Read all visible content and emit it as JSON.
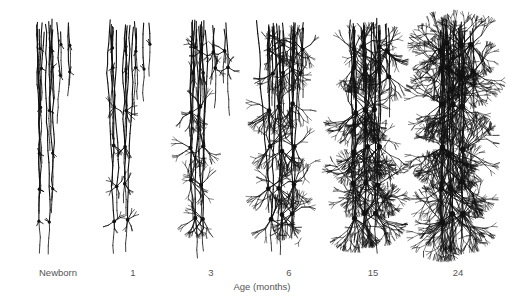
{
  "figure": {
    "axis_label": "Age (months)",
    "stages": [
      {
        "label": "Newborn",
        "x": 58,
        "density": 0
      },
      {
        "label": "1",
        "x": 133,
        "density": 1
      },
      {
        "label": "3",
        "x": 211,
        "density": 2
      },
      {
        "label": "6",
        "x": 289,
        "density": 3
      },
      {
        "label": "15",
        "x": 373,
        "density": 4
      },
      {
        "label": "24",
        "x": 458,
        "density": 5
      }
    ]
  }
}
